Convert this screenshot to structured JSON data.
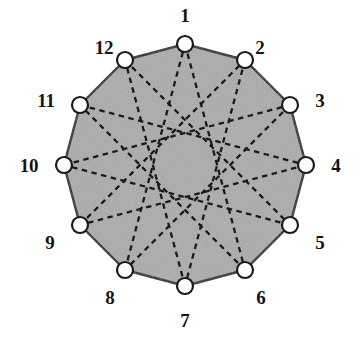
{
  "figure": {
    "name": "dodecagon-star-polygon",
    "background_color": "#ffffff",
    "fill_color": "#ababab",
    "stroke_color": "#1a1a1a",
    "vertex_fill_color": "#ffffff",
    "vertex_stroke_color": "#1a1a1a",
    "chord_style": "dashed",
    "center": {
      "x": 185,
      "y": 165
    },
    "circumradius": 121,
    "vertex_radius": 8,
    "label_radius": 150,
    "chord_step": 5,
    "sides": 12
  },
  "chart_data": {
    "type": "diagram",
    "title": "",
    "subtitle": "",
    "xlabel": "",
    "ylabel": "",
    "shape": "regular dodecagon with {12/5} star polygon chords",
    "vertex_count": 12,
    "chord_step": 5,
    "chord_count": 12,
    "labels": [
      "1",
      "2",
      "3",
      "4",
      "5",
      "6",
      "7",
      "8",
      "9",
      "10",
      "11",
      "12"
    ],
    "vertices": [
      {
        "label": "1",
        "index": 1,
        "angle_deg": -90,
        "x": 185,
        "y": 44,
        "label_x": 185,
        "label_y": 15
      },
      {
        "label": "2",
        "index": 2,
        "angle_deg": -60,
        "x": 245,
        "y": 60,
        "label_x": 260,
        "label_y": 47
      },
      {
        "label": "3",
        "index": 3,
        "angle_deg": -30,
        "x": 290,
        "y": 105,
        "label_x": 320,
        "label_y": 100
      },
      {
        "label": "4",
        "index": 4,
        "angle_deg": 0,
        "x": 306,
        "y": 165,
        "label_x": 336,
        "label_y": 165
      },
      {
        "label": "5",
        "index": 5,
        "angle_deg": 30,
        "x": 290,
        "y": 225,
        "label_x": 320,
        "label_y": 242
      },
      {
        "label": "6",
        "index": 6,
        "angle_deg": 60,
        "x": 245,
        "y": 270,
        "label_x": 261,
        "label_y": 297
      },
      {
        "label": "7",
        "index": 7,
        "angle_deg": 90,
        "x": 185,
        "y": 286,
        "label_x": 185,
        "label_y": 320
      },
      {
        "label": "8",
        "index": 8,
        "angle_deg": 120,
        "x": 125,
        "y": 270,
        "label_x": 110,
        "label_y": 297
      },
      {
        "label": "9",
        "index": 9,
        "angle_deg": 150,
        "x": 80,
        "y": 225,
        "label_x": 50,
        "label_y": 242
      },
      {
        "label": "10",
        "index": 10,
        "angle_deg": 180,
        "x": 64,
        "y": 165,
        "label_x": 29,
        "label_y": 165
      },
      {
        "label": "11",
        "index": 11,
        "angle_deg": 210,
        "x": 80,
        "y": 105,
        "label_x": 46,
        "label_y": 100
      },
      {
        "label": "12",
        "index": 12,
        "angle_deg": 240,
        "x": 125,
        "y": 60,
        "label_x": 104,
        "label_y": 47
      }
    ],
    "chords": [
      [
        1,
        6
      ],
      [
        2,
        7
      ],
      [
        3,
        8
      ],
      [
        4,
        9
      ],
      [
        5,
        10
      ],
      [
        6,
        11
      ],
      [
        7,
        12
      ],
      [
        8,
        1
      ],
      [
        9,
        2
      ],
      [
        10,
        3
      ],
      [
        11,
        4
      ],
      [
        12,
        5
      ]
    ]
  }
}
